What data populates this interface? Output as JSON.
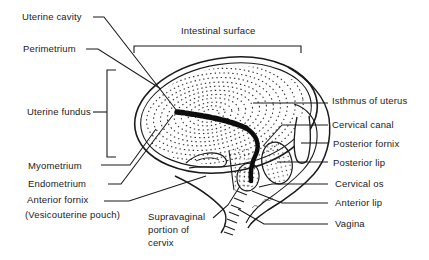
{
  "figure": {
    "background": "#ffffff",
    "ink": "#1a1a1a",
    "top_label": "Intestinal surface",
    "left_labels": [
      "Uterine cavity",
      "Perimetrium",
      "Uterine fundus",
      "Myometrium",
      "Endometrium",
      "Anterior fornix",
      "(Vesicouterine pouch)"
    ],
    "bottom_label": [
      "Supravaginal",
      "portion of",
      "cervix"
    ],
    "right_labels": [
      "Isthmus of uterus",
      "Cervical canal",
      "Posterior fornix",
      "Posterior lip",
      "Cervical os",
      "Anterior lip",
      "Vagina"
    ]
  }
}
